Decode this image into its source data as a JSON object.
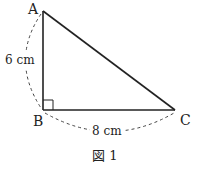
{
  "figure": {
    "caption": "図 1",
    "vertices": {
      "A": {
        "label": "A",
        "x": 43,
        "y": 11
      },
      "B": {
        "label": "B",
        "x": 43,
        "y": 110
      },
      "C": {
        "label": "C",
        "x": 175,
        "y": 110
      }
    },
    "measurements": {
      "AB": "6 cm",
      "BC": "8 cm"
    },
    "right_angle_at": "B",
    "colors": {
      "line": "#222222",
      "dash": "#444444"
    }
  }
}
